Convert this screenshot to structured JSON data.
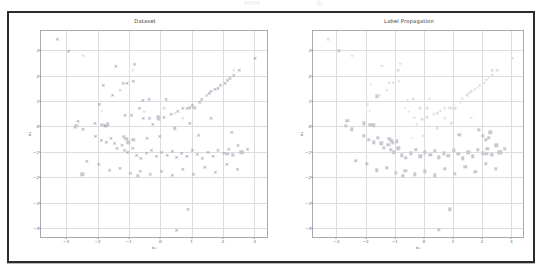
{
  "figure": {
    "background_color": "#ffffff",
    "frame_color": "#2b2b2e",
    "grid_color": "#dcdce1",
    "axis_color": "#a9a9ae"
  },
  "top_artifact": {
    "description": "clipped-header-smudge"
  },
  "chart_data": [
    {
      "type": "scatter",
      "panel": "left",
      "title": "Dataset",
      "xlabel": "x₁",
      "ylabel": "x₂",
      "xlim": [
        -3.8,
        3.4
      ],
      "ylim": [
        -4.35,
        3.75
      ],
      "xticks": [
        -3,
        -2,
        -1,
        0,
        1,
        2,
        3
      ],
      "yticks": [
        3,
        2,
        1,
        0,
        -1,
        -2,
        -3,
        -4
      ],
      "grid": true,
      "legend": null,
      "series": [
        {
          "name": "unlabeled",
          "marker": "x",
          "color": "#8e8e97",
          "points": [
            [
              -3.28,
              3.42
            ],
            [
              -2.92,
              2.96
            ],
            [
              -1.42,
              2.38
            ],
            [
              -0.82,
              2.46
            ],
            [
              -1.82,
              1.64
            ],
            [
              -1.18,
              1.72
            ],
            [
              -1.06,
              1.72
            ],
            [
              -0.86,
              1.78
            ],
            [
              -1.52,
              1.22
            ],
            [
              -0.56,
              1.02
            ],
            [
              -0.36,
              1.06
            ],
            [
              -0.66,
              0.74
            ],
            [
              -2.62,
              0.22
            ],
            [
              -2.08,
              0.12
            ],
            [
              -1.78,
              0.06
            ],
            [
              -1.74,
              0.02
            ],
            [
              -1.12,
              0.46
            ],
            [
              -0.92,
              0.44
            ],
            [
              -0.54,
              0.32
            ],
            [
              -0.34,
              0.34
            ],
            [
              -0.24,
              0.08
            ],
            [
              -0.06,
              0.28
            ],
            [
              0.12,
              0.36
            ],
            [
              0.34,
              0.48
            ],
            [
              0.56,
              0.62
            ],
            [
              0.72,
              0.72
            ],
            [
              0.86,
              0.74
            ],
            [
              1.02,
              0.84
            ],
            [
              1.26,
              0.96
            ],
            [
              1.32,
              1.08
            ],
            [
              1.48,
              1.22
            ],
            [
              1.56,
              1.32
            ],
            [
              1.62,
              1.38
            ],
            [
              1.74,
              1.46
            ],
            [
              1.84,
              1.52
            ],
            [
              1.92,
              1.62
            ],
            [
              2.06,
              1.72
            ],
            [
              2.14,
              1.84
            ],
            [
              2.22,
              1.92
            ],
            [
              2.34,
              2.02
            ],
            [
              2.52,
              2.22
            ],
            [
              3.02,
              2.68
            ],
            [
              -2.46,
              -0.12
            ],
            [
              -2.06,
              -0.36
            ],
            [
              -1.88,
              -0.52
            ],
            [
              -1.72,
              -0.62
            ],
            [
              -1.58,
              -0.46
            ],
            [
              -1.46,
              -0.66
            ],
            [
              -1.38,
              -0.84
            ],
            [
              -1.22,
              -0.72
            ],
            [
              -1.14,
              -0.92
            ],
            [
              -1.04,
              -1.02
            ],
            [
              -0.88,
              -0.86
            ],
            [
              -0.76,
              -1.14
            ],
            [
              -0.62,
              -1.24
            ],
            [
              -0.44,
              -1.06
            ],
            [
              -0.28,
              -0.92
            ],
            [
              -0.12,
              -1.18
            ],
            [
              0.04,
              -1.02
            ],
            [
              0.22,
              -1.12
            ],
            [
              0.38,
              -0.96
            ],
            [
              0.52,
              -1.22
            ],
            [
              0.68,
              -1.06
            ],
            [
              0.84,
              -1.16
            ],
            [
              1.02,
              -0.94
            ],
            [
              1.18,
              -1.08
            ],
            [
              1.34,
              -1.26
            ],
            [
              1.52,
              -1.02
            ],
            [
              1.68,
              -1.18
            ],
            [
              1.84,
              -0.92
            ],
            [
              2.02,
              -1.06
            ],
            [
              2.18,
              -0.88
            ],
            [
              2.32,
              -1.12
            ],
            [
              2.48,
              -0.74
            ],
            [
              2.62,
              -1.02
            ],
            [
              2.78,
              -0.88
            ],
            [
              -2.34,
              -1.36
            ],
            [
              -1.96,
              -1.48
            ],
            [
              -1.62,
              -1.72
            ],
            [
              -1.28,
              -1.62
            ],
            [
              -0.96,
              -1.82
            ],
            [
              -0.64,
              -1.74
            ],
            [
              -0.32,
              -1.88
            ],
            [
              0.04,
              -1.76
            ],
            [
              0.38,
              -1.92
            ],
            [
              0.72,
              -1.68
            ],
            [
              1.06,
              -1.86
            ],
            [
              1.42,
              -1.58
            ],
            [
              1.76,
              -1.78
            ],
            [
              2.12,
              -1.46
            ],
            [
              2.46,
              -1.66
            ],
            [
              0.88,
              -3.26
            ],
            [
              0.52,
              -4.06
            ],
            [
              1.22,
              -0.32
            ],
            [
              2.28,
              -0.24
            ],
            [
              -2.72,
              -0.02
            ],
            [
              -1.94,
              0.88
            ],
            [
              -0.02,
              -0.36
            ],
            [
              0.94,
              0.12
            ],
            [
              1.62,
              0.34
            ],
            [
              0.18,
              1.08
            ],
            [
              -0.42,
              -0.44
            ]
          ]
        },
        {
          "name": "class-a",
          "marker": "square",
          "color": "#c8c8ce",
          "points": [
            [
              -2.68,
              0.02
            ],
            [
              -1.86,
              0.06
            ],
            [
              -1.68,
              0.08
            ],
            [
              -1.16,
              -0.42
            ],
            [
              -1.08,
              -0.48
            ],
            [
              -1.02,
              -0.62
            ],
            [
              -0.86,
              -0.52
            ],
            [
              0.46,
              -0.08
            ],
            [
              0.94,
              0.72
            ],
            [
              1.08,
              0.72
            ],
            [
              2.14,
              -1.08
            ],
            [
              2.32,
              -1.12
            ],
            [
              -2.48,
              -1.88
            ],
            [
              -0.72,
              -1.94
            ],
            [
              -0.06,
              0.36
            ],
            [
              2.58,
              -1.02
            ]
          ]
        },
        {
          "name": "class-b",
          "marker": "dot",
          "color": "#e0e0e6",
          "points": [
            [
              -2.46,
              2.78
            ],
            [
              -0.88,
              2.22
            ],
            [
              -1.86,
              0.62
            ],
            [
              -0.52,
              0.58
            ],
            [
              0.12,
              0.72
            ],
            [
              0.46,
              0.52
            ],
            [
              2.34,
              2.22
            ],
            [
              1.48,
              1.24
            ],
            [
              -1.28,
              1.42
            ],
            [
              0.72,
              0.32
            ]
          ]
        }
      ]
    },
    {
      "type": "scatter",
      "panel": "right",
      "title": "Label Propagation",
      "xlabel": "x₁",
      "ylabel": "x₂",
      "xlim": [
        -3.8,
        3.4
      ],
      "ylim": [
        -4.35,
        3.75
      ],
      "xticks": [
        -3,
        -2,
        -1,
        0,
        1,
        2,
        3
      ],
      "yticks": [
        3,
        2,
        1,
        0,
        -1,
        -2,
        -3,
        -4
      ],
      "grid": true,
      "legend": null,
      "series": [
        {
          "name": "class-a",
          "marker": "square",
          "color": "#c8c8ce",
          "points": [
            [
              -2.92,
              2.96
            ],
            [
              -2.06,
              0.12
            ],
            [
              -1.78,
              0.06
            ],
            [
              -1.72,
              0.04
            ],
            [
              -1.62,
              1.18
            ],
            [
              -2.62,
              0.22
            ],
            [
              -2.46,
              -0.12
            ],
            [
              -2.06,
              -0.36
            ],
            [
              -1.88,
              -0.52
            ],
            [
              -1.72,
              -0.62
            ],
            [
              -1.58,
              -0.46
            ],
            [
              -1.46,
              -0.66
            ],
            [
              -1.38,
              -0.84
            ],
            [
              -1.22,
              -0.72
            ],
            [
              -1.14,
              -0.92
            ],
            [
              -1.04,
              -1.02
            ],
            [
              -0.88,
              -0.86
            ],
            [
              -0.76,
              -1.14
            ],
            [
              -0.62,
              -1.24
            ],
            [
              -1.18,
              -0.48
            ],
            [
              -1.12,
              -0.56
            ],
            [
              -1.06,
              -0.64
            ],
            [
              -0.92,
              -0.58
            ],
            [
              -2.34,
              -1.36
            ],
            [
              -1.96,
              -1.48
            ],
            [
              -1.62,
              -1.72
            ],
            [
              -1.28,
              -1.62
            ],
            [
              -0.96,
              -1.82
            ],
            [
              -0.64,
              -1.74
            ],
            [
              -0.32,
              -1.88
            ],
            [
              0.04,
              -1.76
            ],
            [
              0.38,
              -1.92
            ],
            [
              0.72,
              -1.68
            ],
            [
              1.06,
              -1.86
            ],
            [
              1.42,
              -1.58
            ],
            [
              1.76,
              -1.78
            ],
            [
              2.12,
              -1.46
            ],
            [
              2.46,
              -1.66
            ],
            [
              -0.44,
              -1.06
            ],
            [
              -0.28,
              -0.92
            ],
            [
              -0.12,
              -1.18
            ],
            [
              0.04,
              -1.02
            ],
            [
              0.22,
              -1.12
            ],
            [
              0.38,
              -0.96
            ],
            [
              0.52,
              -1.22
            ],
            [
              0.68,
              -1.06
            ],
            [
              0.84,
              -1.16
            ],
            [
              1.02,
              -0.94
            ],
            [
              1.18,
              -1.08
            ],
            [
              1.34,
              -1.26
            ],
            [
              1.52,
              -1.02
            ],
            [
              1.68,
              -1.18
            ],
            [
              1.84,
              -0.92
            ],
            [
              2.02,
              -1.06
            ],
            [
              2.18,
              -0.88
            ],
            [
              2.32,
              -1.12
            ],
            [
              2.48,
              -0.74
            ],
            [
              2.62,
              -1.02
            ],
            [
              2.78,
              -0.88
            ],
            [
              0.88,
              -3.26
            ],
            [
              0.52,
              -4.06
            ],
            [
              1.22,
              -0.32
            ],
            [
              2.28,
              -0.24
            ],
            [
              -2.68,
              0.02
            ],
            [
              -1.86,
              0.06
            ],
            [
              2.14,
              -1.08
            ],
            [
              2.32,
              -1.12
            ],
            [
              2.58,
              -1.02
            ],
            [
              -0.72,
              -1.94
            ],
            [
              1.88,
              -0.14
            ],
            [
              2.02,
              -0.38
            ],
            [
              2.12,
              -0.52
            ],
            [
              2.22,
              -0.44
            ]
          ]
        },
        {
          "name": "class-b",
          "marker": "dot",
          "color": "#e0e0e6",
          "points": [
            [
              -3.28,
              3.42
            ],
            [
              -2.46,
              2.78
            ],
            [
              -1.42,
              2.38
            ],
            [
              -0.82,
              2.46
            ],
            [
              -0.88,
              2.22
            ],
            [
              -1.82,
              1.64
            ],
            [
              -1.18,
              1.72
            ],
            [
              -1.06,
              1.72
            ],
            [
              -0.86,
              1.78
            ],
            [
              -1.52,
              1.22
            ],
            [
              -1.28,
              1.42
            ],
            [
              -1.86,
              0.62
            ],
            [
              -0.56,
              1.02
            ],
            [
              -0.36,
              1.06
            ],
            [
              -0.66,
              0.74
            ],
            [
              -0.52,
              0.58
            ],
            [
              -0.12,
              0.72
            ],
            [
              0.12,
              0.72
            ],
            [
              0.46,
              0.52
            ],
            [
              0.18,
              1.08
            ],
            [
              -0.34,
              0.34
            ],
            [
              -0.24,
              0.08
            ],
            [
              -0.06,
              0.28
            ],
            [
              0.12,
              0.36
            ],
            [
              0.34,
              0.48
            ],
            [
              0.56,
              0.62
            ],
            [
              0.72,
              0.72
            ],
            [
              0.86,
              0.74
            ],
            [
              1.02,
              0.84
            ],
            [
              1.26,
              0.96
            ],
            [
              1.32,
              1.08
            ],
            [
              1.48,
              1.22
            ],
            [
              1.56,
              1.32
            ],
            [
              1.62,
              1.38
            ],
            [
              1.74,
              1.46
            ],
            [
              1.84,
              1.52
            ],
            [
              1.92,
              1.62
            ],
            [
              2.06,
              1.72
            ],
            [
              2.14,
              1.84
            ],
            [
              2.22,
              1.92
            ],
            [
              2.34,
              2.02
            ],
            [
              2.52,
              2.22
            ],
            [
              3.02,
              2.68
            ],
            [
              2.34,
              2.22
            ],
            [
              -1.94,
              0.88
            ],
            [
              0.94,
              0.12
            ],
            [
              1.62,
              0.34
            ],
            [
              0.72,
              0.32
            ],
            [
              -0.02,
              -0.36
            ],
            [
              0.46,
              -0.08
            ],
            [
              -0.42,
              -0.44
            ],
            [
              0.94,
              0.72
            ],
            [
              1.08,
              0.72
            ],
            [
              1.48,
              1.24
            ]
          ]
        }
      ]
    }
  ]
}
